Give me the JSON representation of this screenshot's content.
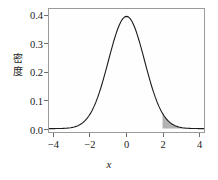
{
  "chart_data": {
    "type": "line",
    "title": "",
    "subtitle": "",
    "xlabel": "x",
    "ylabel": "密度",
    "xlim": [
      -4.3,
      4.3
    ],
    "ylim": [
      -0.012,
      0.425
    ],
    "grid": false,
    "legend": null,
    "x_ticks": [
      {
        "value": -4,
        "label": "−4"
      },
      {
        "value": -2,
        "label": "−2"
      },
      {
        "value": 0,
        "label": "0"
      },
      {
        "value": 2,
        "label": "2"
      },
      {
        "value": 4,
        "label": "4"
      }
    ],
    "y_ticks": [
      {
        "value": 0.0,
        "label": "0.0"
      },
      {
        "value": 0.1,
        "label": "0.1"
      },
      {
        "value": 0.2,
        "label": "0.2"
      },
      {
        "value": 0.3,
        "label": "0.3"
      },
      {
        "value": 0.4,
        "label": "0.4"
      }
    ],
    "series": [
      {
        "name": "standard normal density",
        "type": "line",
        "color": "#1c1c1c",
        "line_width": 1.1,
        "x": [
          -4.3,
          -4.2,
          -4.1,
          -4.0,
          -3.9,
          -3.8,
          -3.7,
          -3.6,
          -3.5,
          -3.4,
          -3.3,
          -3.2,
          -3.1,
          -3.0,
          -2.9,
          -2.8,
          -2.7,
          -2.6,
          -2.5,
          -2.4,
          -2.3,
          -2.2,
          -2.1,
          -2.0,
          -1.9,
          -1.8,
          -1.7,
          -1.6,
          -1.5,
          -1.4,
          -1.3,
          -1.2,
          -1.1,
          -1.0,
          -0.9,
          -0.8,
          -0.7,
          -0.6,
          -0.5,
          -0.4,
          -0.3,
          -0.2,
          -0.1,
          0.0,
          0.1,
          0.2,
          0.3,
          0.4,
          0.5,
          0.6,
          0.7,
          0.8,
          0.9,
          1.0,
          1.1,
          1.2,
          1.3,
          1.4,
          1.5,
          1.6,
          1.7,
          1.8,
          1.9,
          2.0,
          2.1,
          2.2,
          2.3,
          2.4,
          2.5,
          2.6,
          2.7,
          2.8,
          2.9,
          3.0,
          3.1,
          3.2,
          3.3,
          3.4,
          3.5,
          3.6,
          3.7,
          3.8,
          3.9,
          4.0,
          4.1,
          4.2,
          4.3
        ],
        "y": [
          0.0,
          0.0001,
          0.0001,
          0.0001,
          0.0002,
          0.0003,
          0.0004,
          0.0006,
          0.0009,
          0.0012,
          0.0017,
          0.0024,
          0.0033,
          0.0044,
          0.006,
          0.0079,
          0.0104,
          0.0136,
          0.0175,
          0.0224,
          0.0283,
          0.0355,
          0.044,
          0.054,
          0.0656,
          0.079,
          0.094,
          0.1109,
          0.1295,
          0.1497,
          0.1714,
          0.1942,
          0.2179,
          0.242,
          0.2661,
          0.2897,
          0.3123,
          0.3332,
          0.3521,
          0.3683,
          0.3814,
          0.391,
          0.397,
          0.3989,
          0.397,
          0.391,
          0.3814,
          0.3683,
          0.3521,
          0.3332,
          0.3123,
          0.2897,
          0.2661,
          0.242,
          0.2179,
          0.1942,
          0.1714,
          0.1497,
          0.1295,
          0.1109,
          0.094,
          0.079,
          0.0656,
          0.054,
          0.044,
          0.0355,
          0.0283,
          0.0224,
          0.0175,
          0.0136,
          0.0104,
          0.0079,
          0.006,
          0.0044,
          0.0033,
          0.0024,
          0.0017,
          0.0012,
          0.0009,
          0.0006,
          0.0004,
          0.0003,
          0.0002,
          0.0001,
          0.0001,
          0.0001,
          0.0
        ]
      }
    ],
    "shaded_regions": [
      {
        "name": "right-tail",
        "x_from": 2.0,
        "x_to": 4.3,
        "fill_color": "#b3b3b3",
        "description": "shaded area under the density curve for x >= 2"
      }
    ],
    "panel": {
      "background_color": "#fefefe",
      "border_color": "#9a9a9a"
    }
  }
}
